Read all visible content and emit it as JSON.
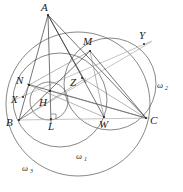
{
  "figure": {
    "kind": "euclidean-geometry-diagram",
    "width": 183,
    "height": 192,
    "background": "#ffffff",
    "stroke_dark": "#3a3a3a",
    "stroke_circle": "#555555",
    "stroke_light": "#aaaaaa"
  },
  "labels": {
    "A": "A",
    "B": "B",
    "C": "C",
    "M": "M",
    "N": "N",
    "X": "X",
    "Y": "Y",
    "Z": "Z",
    "H": "H",
    "L": "L",
    "W": "W",
    "omega1": "ω",
    "omega1_sub": "1",
    "omega2": "ω",
    "omega2_sub": "2",
    "omega3": "ω",
    "omega3_sub": "3"
  },
  "points": [
    {
      "name": "A",
      "x": 48,
      "y": 15,
      "label": "A",
      "label_x": 42,
      "label_y": 9
    },
    {
      "name": "B",
      "x": 19,
      "y": 120,
      "label": "B",
      "label_x": 8,
      "label_y": 124
    },
    {
      "name": "C",
      "x": 146,
      "y": 118,
      "label": "C",
      "label_x": 150,
      "label_y": 123
    },
    {
      "name": "M",
      "x": 90,
      "y": 51,
      "label": "M",
      "label_x": 84,
      "label_y": 44
    },
    {
      "name": "N",
      "x": 29,
      "y": 85,
      "label": "N",
      "label_x": 19,
      "label_y": 80
    },
    {
      "name": "X",
      "x": 23,
      "y": 97,
      "label": "X",
      "label_x": 13,
      "label_y": 101
    },
    {
      "name": "Y",
      "x": 144,
      "y": 44,
      "label": "Y",
      "label_x": 141,
      "label_y": 38
    },
    {
      "name": "Z",
      "x": 82,
      "y": 78,
      "label": "Z",
      "label_x": 71,
      "label_y": 86
    },
    {
      "name": "H",
      "x": 50,
      "y": 91,
      "label": "H",
      "label_x": 41,
      "label_y": 105
    },
    {
      "name": "L",
      "x": 51,
      "y": 119,
      "label": "L",
      "label_x": 50,
      "label_y": 129
    },
    {
      "name": "W",
      "x": 104,
      "y": 117,
      "label": "W",
      "label_x": 101,
      "label_y": 127
    }
  ],
  "circles": [
    {
      "name": "omega1",
      "cx": 60,
      "cy": 100,
      "r": 47,
      "label_x": 78,
      "label_y": 158
    },
    {
      "name": "omega2",
      "cx": 110,
      "cy": 84,
      "r": 46,
      "label_x": 158,
      "label_y": 88
    },
    {
      "name": "omega3",
      "cx": 78,
      "cy": 104,
      "r": 72,
      "label_x": 24,
      "label_y": 170
    },
    {
      "name": "incircle_small",
      "cx": 49,
      "cy": 101,
      "r": 19,
      "label_x": 0,
      "label_y": 0
    }
  ],
  "segments": [
    {
      "name": "AB",
      "from": "A",
      "to": "B",
      "style": "dark"
    },
    {
      "name": "AC",
      "from": "A",
      "to": "C",
      "style": "dark"
    },
    {
      "name": "BC",
      "from": "B",
      "to": "C",
      "style": "light"
    },
    {
      "name": "AL",
      "from": "A",
      "to": "L",
      "style": "dark"
    },
    {
      "name": "AW",
      "from": "A",
      "to": "W",
      "style": "dark"
    },
    {
      "name": "AZ",
      "from": "A",
      "to": "Z",
      "style": "dark"
    },
    {
      "name": "NC",
      "from": "N",
      "to": "C",
      "style": "dark"
    },
    {
      "name": "NW",
      "from": "N",
      "to": "W",
      "style": "thin"
    },
    {
      "name": "MB",
      "from": "M",
      "to": "B",
      "style": "dark"
    },
    {
      "name": "MC",
      "from": "M",
      "to": "C",
      "style": "dark"
    },
    {
      "name": "MW",
      "from": "M",
      "to": "W",
      "style": "thin"
    },
    {
      "name": "MN",
      "from": "M",
      "to": "N",
      "style": "thin"
    },
    {
      "name": "XY",
      "from": "X",
      "to": "Y",
      "style": "light"
    },
    {
      "name": "BY",
      "from": "B",
      "to": "Y",
      "style": "light"
    },
    {
      "name": "ZC",
      "from": "Z",
      "to": "C",
      "style": "thin"
    },
    {
      "name": "HC",
      "from": "H",
      "to": "C",
      "style": "thin"
    },
    {
      "name": "BZ",
      "from": "B",
      "to": "Z",
      "style": "thin"
    },
    {
      "name": "BM_ext",
      "from": "B",
      "to": "Y",
      "style": "light"
    }
  ],
  "marks": [
    {
      "name": "right-angle-at-L",
      "x": 51,
      "y": 119,
      "size": 5
    }
  ]
}
